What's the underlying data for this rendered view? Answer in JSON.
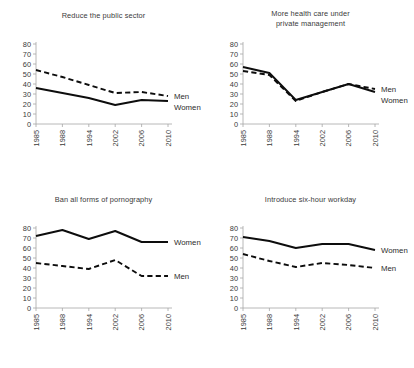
{
  "figure": {
    "background": "#ffffff",
    "panel_count": 4,
    "line_color": "#0d0d0d",
    "axis_color": "#a6a6a6"
  },
  "chart_data": [
    {
      "type": "line",
      "title": "Reduce the public sector",
      "xlabel": "",
      "ylabel": "",
      "x": [
        "1985",
        "1988",
        "1994",
        "2002",
        "2006",
        "2010"
      ],
      "categories": [
        "1985",
        "1988",
        "1994",
        "2002",
        "2006",
        "2010"
      ],
      "yticks": [
        0,
        10,
        20,
        30,
        40,
        50,
        60,
        70,
        80
      ],
      "ylim": [
        0,
        80
      ],
      "grid": false,
      "legend_position": "right-inline",
      "series": [
        {
          "name": "Men",
          "style": "dashed",
          "label": "Men",
          "values": [
            54,
            47,
            39,
            31,
            32,
            28
          ]
        },
        {
          "name": "Women",
          "style": "solid",
          "label": "Women",
          "values": [
            36,
            31,
            26,
            19,
            24,
            23
          ]
        }
      ]
    },
    {
      "type": "line",
      "title": "More health care under\nprivate management",
      "xlabel": "",
      "ylabel": "",
      "x": [
        "1985",
        "1988",
        "1994",
        "2002",
        "2006",
        "2010"
      ],
      "categories": [
        "1985",
        "1988",
        "1994",
        "2002",
        "2006",
        "2010"
      ],
      "yticks": [
        0,
        10,
        20,
        30,
        40,
        50,
        60,
        70,
        80
      ],
      "ylim": [
        0,
        80
      ],
      "grid": false,
      "legend_position": "right-inline",
      "series": [
        {
          "name": "Men",
          "style": "dashed",
          "label": "Men",
          "values": [
            53,
            49,
            23,
            32,
            40,
            35
          ]
        },
        {
          "name": "Women",
          "style": "solid",
          "label": "Women",
          "values": [
            57,
            51,
            24,
            32,
            40,
            32
          ]
        }
      ]
    },
    {
      "type": "line",
      "title": "Ban all forms of pornography",
      "xlabel": "",
      "ylabel": "",
      "x": [
        "1985",
        "1988",
        "1994",
        "2002",
        "2006",
        "2010"
      ],
      "categories": [
        "1985",
        "1988",
        "1994",
        "2002",
        "2006",
        "2010"
      ],
      "yticks": [
        0,
        10,
        20,
        30,
        40,
        50,
        60,
        70,
        80
      ],
      "ylim": [
        0,
        80
      ],
      "grid": false,
      "legend_position": "right-inline",
      "series": [
        {
          "name": "Women",
          "style": "solid",
          "label": "Women",
          "values": [
            72,
            78,
            69,
            77,
            66,
            66
          ]
        },
        {
          "name": "Men",
          "style": "dashed",
          "label": "Men",
          "values": [
            45,
            42,
            39,
            48,
            32,
            32
          ]
        }
      ]
    },
    {
      "type": "line",
      "title": "Introduce six-hour workday",
      "xlabel": "",
      "ylabel": "",
      "x": [
        "1985",
        "1988",
        "1994",
        "2002",
        "2006",
        "2010"
      ],
      "categories": [
        "1985",
        "1988",
        "1994",
        "2002",
        "2006",
        "2010"
      ],
      "yticks": [
        0,
        10,
        20,
        30,
        40,
        50,
        60,
        70,
        80
      ],
      "ylim": [
        0,
        80
      ],
      "grid": false,
      "legend_position": "right-inline",
      "series": [
        {
          "name": "Women",
          "style": "solid",
          "label": "Women",
          "values": [
            71,
            67,
            60,
            64,
            64,
            58
          ]
        },
        {
          "name": "Men",
          "style": "dashed",
          "label": "Men",
          "values": [
            54,
            47,
            41,
            45,
            43,
            40
          ]
        }
      ]
    }
  ]
}
